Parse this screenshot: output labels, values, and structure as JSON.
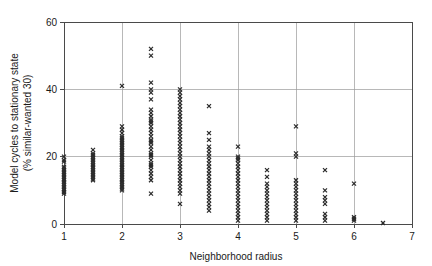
{
  "chart_data": {
    "type": "scatter",
    "title": "",
    "xlabel": "Neighborhood radius",
    "ylabel": "Model cycles to stationary state\n(% similar-wanted 30)",
    "ylabel_line1": "Model cycles to stationary state",
    "ylabel_line2": "(% similar-wanted 30)",
    "xlim": [
      1,
      7
    ],
    "ylim": [
      0,
      60
    ],
    "xticks": [
      1,
      2,
      3,
      4,
      5,
      6,
      7
    ],
    "yticks": [
      0,
      20,
      40,
      60
    ],
    "xtick_labels": [
      "1",
      "2",
      "3",
      "4",
      "5",
      "6",
      "7"
    ],
    "ytick_labels": [
      "0",
      "20",
      "40",
      "60"
    ],
    "grid": true,
    "grid_vertical_at": [
      2,
      3,
      4,
      5,
      6
    ],
    "grid_horizontal_at": [
      20,
      40
    ],
    "legend": null,
    "marker": "x",
    "marker_color": "#2b2b2b",
    "marker_size": 4,
    "series": [
      {
        "name": "runs",
        "points": [
          [
            1,
            20
          ],
          [
            1,
            19
          ],
          [
            1,
            18.5
          ],
          [
            1,
            17
          ],
          [
            1,
            16.5
          ],
          [
            1,
            16
          ],
          [
            1,
            15.5
          ],
          [
            1,
            15
          ],
          [
            1,
            14.5
          ],
          [
            1,
            14
          ],
          [
            1,
            13.5
          ],
          [
            1,
            13
          ],
          [
            1,
            12.5
          ],
          [
            1,
            12
          ],
          [
            1,
            11.5
          ],
          [
            1,
            11
          ],
          [
            1,
            10.5
          ],
          [
            1,
            10
          ],
          [
            1,
            9.5
          ],
          [
            1,
            9
          ],
          [
            1.5,
            22
          ],
          [
            1.5,
            21
          ],
          [
            1.5,
            20.5
          ],
          [
            1.5,
            20
          ],
          [
            1.5,
            19.5
          ],
          [
            1.5,
            19
          ],
          [
            1.5,
            18.5
          ],
          [
            1.5,
            18
          ],
          [
            1.5,
            17.5
          ],
          [
            1.5,
            17
          ],
          [
            1.5,
            16.5
          ],
          [
            1.5,
            16
          ],
          [
            1.5,
            15.5
          ],
          [
            1.5,
            15
          ],
          [
            1.5,
            14.5
          ],
          [
            1.5,
            14
          ],
          [
            1.5,
            13.5
          ],
          [
            1.5,
            13
          ],
          [
            2,
            41
          ],
          [
            2,
            29
          ],
          [
            2,
            28
          ],
          [
            2,
            27
          ],
          [
            2,
            26
          ],
          [
            2,
            25.5
          ],
          [
            2,
            25
          ],
          [
            2,
            24.5
          ],
          [
            2,
            24
          ],
          [
            2,
            23.5
          ],
          [
            2,
            23
          ],
          [
            2,
            22.5
          ],
          [
            2,
            22
          ],
          [
            2,
            21.5
          ],
          [
            2,
            21
          ],
          [
            2,
            20.5
          ],
          [
            2,
            20
          ],
          [
            2,
            19.5
          ],
          [
            2,
            19
          ],
          [
            2,
            18.5
          ],
          [
            2,
            18
          ],
          [
            2,
            17.5
          ],
          [
            2,
            17
          ],
          [
            2,
            16.5
          ],
          [
            2,
            16
          ],
          [
            2,
            15.5
          ],
          [
            2,
            15
          ],
          [
            2,
            14.5
          ],
          [
            2,
            14
          ],
          [
            2,
            13.5
          ],
          [
            2,
            13
          ],
          [
            2,
            12.5
          ],
          [
            2,
            12
          ],
          [
            2,
            11.5
          ],
          [
            2,
            11
          ],
          [
            2,
            10.5
          ],
          [
            2,
            10
          ],
          [
            2.5,
            52
          ],
          [
            2.5,
            50
          ],
          [
            2.5,
            42
          ],
          [
            2.5,
            40
          ],
          [
            2.5,
            39
          ],
          [
            2.5,
            37
          ],
          [
            2.5,
            34
          ],
          [
            2.5,
            33
          ],
          [
            2.5,
            32
          ],
          [
            2.5,
            31
          ],
          [
            2.5,
            30.5
          ],
          [
            2.5,
            30
          ],
          [
            2.5,
            29
          ],
          [
            2.5,
            28
          ],
          [
            2.5,
            27
          ],
          [
            2.5,
            26
          ],
          [
            2.5,
            25
          ],
          [
            2.5,
            24.5
          ],
          [
            2.5,
            24
          ],
          [
            2.5,
            23
          ],
          [
            2.5,
            22
          ],
          [
            2.5,
            21
          ],
          [
            2.5,
            20.5
          ],
          [
            2.5,
            20
          ],
          [
            2.5,
            19
          ],
          [
            2.5,
            18
          ],
          [
            2.5,
            17.5
          ],
          [
            2.5,
            17
          ],
          [
            2.5,
            16
          ],
          [
            2.5,
            15
          ],
          [
            2.5,
            14
          ],
          [
            2.5,
            13
          ],
          [
            2.5,
            9
          ],
          [
            3,
            40
          ],
          [
            3,
            39
          ],
          [
            3,
            38
          ],
          [
            3,
            37
          ],
          [
            3,
            36
          ],
          [
            3,
            35
          ],
          [
            3,
            34
          ],
          [
            3,
            33
          ],
          [
            3,
            32
          ],
          [
            3,
            31
          ],
          [
            3,
            30
          ],
          [
            3,
            29
          ],
          [
            3,
            28
          ],
          [
            3,
            27
          ],
          [
            3,
            26
          ],
          [
            3,
            25
          ],
          [
            3,
            24
          ],
          [
            3,
            23
          ],
          [
            3,
            22
          ],
          [
            3,
            21
          ],
          [
            3,
            20
          ],
          [
            3,
            19
          ],
          [
            3,
            18
          ],
          [
            3,
            17
          ],
          [
            3,
            16
          ],
          [
            3,
            15
          ],
          [
            3,
            14
          ],
          [
            3,
            13
          ],
          [
            3,
            12
          ],
          [
            3,
            11
          ],
          [
            3,
            10
          ],
          [
            3,
            9
          ],
          [
            3,
            6
          ],
          [
            3.5,
            35
          ],
          [
            3.5,
            27
          ],
          [
            3.5,
            25
          ],
          [
            3.5,
            23
          ],
          [
            3.5,
            22
          ],
          [
            3.5,
            21
          ],
          [
            3.5,
            20
          ],
          [
            3.5,
            19
          ],
          [
            3.5,
            18
          ],
          [
            3.5,
            17
          ],
          [
            3.5,
            16
          ],
          [
            3.5,
            15
          ],
          [
            3.5,
            14
          ],
          [
            3.5,
            13
          ],
          [
            3.5,
            12
          ],
          [
            3.5,
            11
          ],
          [
            3.5,
            10
          ],
          [
            3.5,
            9
          ],
          [
            3.5,
            8
          ],
          [
            3.5,
            7
          ],
          [
            3.5,
            6
          ],
          [
            3.5,
            5
          ],
          [
            3.5,
            4
          ],
          [
            4,
            23
          ],
          [
            4,
            20
          ],
          [
            4,
            19.5
          ],
          [
            4,
            19
          ],
          [
            4,
            18
          ],
          [
            4,
            17
          ],
          [
            4,
            16
          ],
          [
            4,
            15
          ],
          [
            4,
            14
          ],
          [
            4,
            13
          ],
          [
            4,
            12
          ],
          [
            4,
            11
          ],
          [
            4,
            10
          ],
          [
            4,
            9
          ],
          [
            4,
            8
          ],
          [
            4,
            7
          ],
          [
            4,
            6
          ],
          [
            4,
            5
          ],
          [
            4,
            4
          ],
          [
            4,
            3
          ],
          [
            4,
            2
          ],
          [
            4,
            1
          ],
          [
            4.5,
            16
          ],
          [
            4.5,
            14
          ],
          [
            4.5,
            12
          ],
          [
            4.5,
            11
          ],
          [
            4.5,
            10
          ],
          [
            4.5,
            9
          ],
          [
            4.5,
            8
          ],
          [
            4.5,
            7
          ],
          [
            4.5,
            6
          ],
          [
            4.5,
            5
          ],
          [
            4.5,
            4
          ],
          [
            4.5,
            3
          ],
          [
            4.5,
            2
          ],
          [
            4.5,
            1
          ],
          [
            5,
            29
          ],
          [
            5,
            21
          ],
          [
            5,
            20
          ],
          [
            5,
            13
          ],
          [
            5,
            12
          ],
          [
            5,
            11
          ],
          [
            5,
            10
          ],
          [
            5,
            9
          ],
          [
            5,
            8
          ],
          [
            5,
            7
          ],
          [
            5,
            6
          ],
          [
            5,
            5
          ],
          [
            5,
            4
          ],
          [
            5,
            3
          ],
          [
            5,
            2
          ],
          [
            5,
            1
          ],
          [
            5.5,
            16
          ],
          [
            5.5,
            10
          ],
          [
            5.5,
            8
          ],
          [
            5.5,
            7
          ],
          [
            5.5,
            6
          ],
          [
            5.5,
            3
          ],
          [
            5.5,
            2
          ],
          [
            5.5,
            1
          ],
          [
            6,
            12
          ],
          [
            6,
            2
          ],
          [
            6,
            1.5
          ],
          [
            6,
            1
          ],
          [
            6.5,
            0.3
          ]
        ]
      }
    ]
  }
}
